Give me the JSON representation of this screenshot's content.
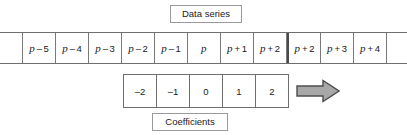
{
  "figure": {
    "background_color": "#ffffff",
    "line_color": "#6e6e6e"
  },
  "data_series": {
    "caption": "Data series",
    "cells": [
      {
        "var": "p",
        "op": "–",
        "offset": "5",
        "text": "p – 5"
      },
      {
        "var": "p",
        "op": "–",
        "offset": "4",
        "text": "p – 4"
      },
      {
        "var": "p",
        "op": "–",
        "offset": "3",
        "text": "p – 3"
      },
      {
        "var": "p",
        "op": "–",
        "offset": "2",
        "text": "p – 2"
      },
      {
        "var": "p",
        "op": "–",
        "offset": "1",
        "text": "p –1"
      },
      {
        "var": "p",
        "op": "",
        "offset": "",
        "text": "p"
      },
      {
        "var": "p",
        "op": "+",
        "offset": "1",
        "text": "p + 1"
      },
      {
        "var": "p",
        "op": "+",
        "offset": "2",
        "text": "p + 2"
      },
      {
        "var": "p",
        "op": "+",
        "offset": "2",
        "text": "p + 2"
      },
      {
        "var": "p",
        "op": "+",
        "offset": "3",
        "text": "p + 3"
      },
      {
        "var": "p",
        "op": "+",
        "offset": "4",
        "text": "p + 4"
      }
    ],
    "group_break_index": 8
  },
  "coefficients": {
    "caption": "Coefficients",
    "values": [
      "–2",
      "–1",
      "0",
      "1",
      "2"
    ]
  },
  "arrow": {
    "icon": "right-arrow-icon",
    "direction": "right",
    "fill_color": "#a8a8a8",
    "stroke_color": "#4d4d4d"
  }
}
